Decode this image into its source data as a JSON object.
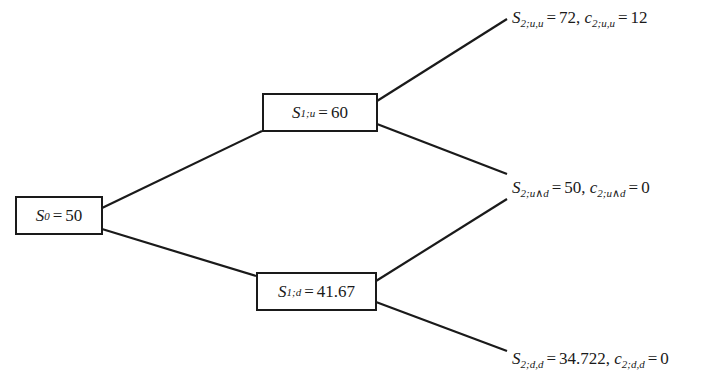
{
  "diagram": {
    "type": "binomial-tree",
    "nodes": {
      "s0": {
        "var": "S",
        "sub": "0",
        "value": "50"
      },
      "s1u": {
        "var": "S",
        "sub": "1;u",
        "value": "60"
      },
      "s1d": {
        "var": "S",
        "sub": "1;d",
        "value": "41.67"
      }
    },
    "leaves": {
      "uu": {
        "s_var": "S",
        "s_sub": "2;u,u",
        "s_value": "72",
        "sep": ",",
        "c_var": "c",
        "c_sub": "2;u,u",
        "c_value": "12"
      },
      "ud": {
        "s_var": "S",
        "s_sub": "2;u∧d",
        "s_value": "50",
        "sep": ",",
        "c_var": "c",
        "c_sub": "2;u∧d",
        "c_value": "0"
      },
      "dd": {
        "s_var": "S",
        "s_sub": "2;d,d",
        "s_value": "34.722",
        "sep": ",",
        "c_var": "c",
        "c_sub": "2;d,d",
        "c_value": "0"
      }
    },
    "eq": "=",
    "edges": [
      {
        "from": "s0",
        "to": "s1u"
      },
      {
        "from": "s0",
        "to": "s1d"
      },
      {
        "from": "s1u",
        "to": "uu"
      },
      {
        "from": "s1u",
        "to": "ud"
      },
      {
        "from": "s1d",
        "to": "ud"
      },
      {
        "from": "s1d",
        "to": "dd"
      }
    ]
  }
}
